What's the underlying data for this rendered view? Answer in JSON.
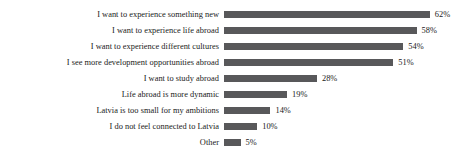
{
  "chart_data": {
    "type": "bar",
    "orientation": "horizontal",
    "title": "",
    "subtitle": "",
    "xlabel": "",
    "ylabel": "",
    "xlim": [
      0,
      62
    ],
    "grid": false,
    "legend": false,
    "value_suffix": "%",
    "bar_color": "#58585a",
    "background_color": "#ffffff",
    "text_color": "#1a1a1a",
    "categories": [
      "I want to experience something new",
      "I want to experience life abroad",
      "I want to experience different cultures",
      "I see more development opportunities abroad",
      "I want to study abroad",
      "Life abroad is more dynamic",
      "Latvia is too small for my ambitions",
      "I do not feel connected to Latvia",
      "Other"
    ],
    "values": [
      62,
      58,
      54,
      51,
      28,
      19,
      14,
      10,
      5
    ],
    "value_labels": [
      "62%",
      "58%",
      "54%",
      "51%",
      "28%",
      "19%",
      "14%",
      "10%",
      "5%"
    ]
  }
}
